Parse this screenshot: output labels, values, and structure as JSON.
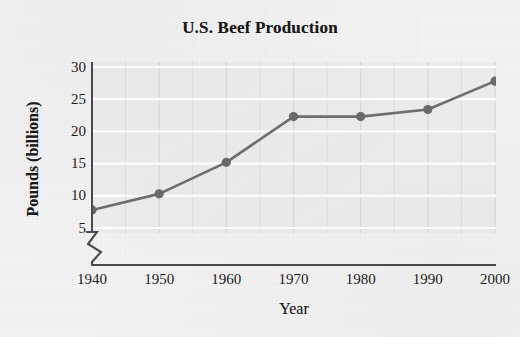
{
  "chart_data": {
    "type": "line",
    "title": "U.S. Beef Production",
    "xlabel": "Year",
    "ylabel": "Pounds (billions)",
    "x": [
      1940,
      1950,
      1960,
      1970,
      1980,
      1990,
      2000
    ],
    "values": [
      7.8,
      10.3,
      15.2,
      22.3,
      22.3,
      23.4,
      27.8
    ],
    "categories": [
      "1940",
      "1950",
      "1960",
      "1970",
      "1980",
      "1990",
      "2000"
    ],
    "xtick_labels": [
      "1940",
      "1950",
      "1960",
      "1970",
      "1980",
      "1990",
      "2000"
    ],
    "ytick_labels": [
      "30",
      "25",
      "20",
      "15",
      "10",
      "5"
    ],
    "ytick_values": [
      30,
      25,
      20,
      15,
      10,
      5
    ],
    "xlim": [
      1940,
      2000
    ],
    "ylim": [
      5,
      30
    ],
    "y_axis_break": true,
    "grid": true,
    "grid_minor_x": true,
    "legend": "none",
    "series": [
      {
        "name": "U.S. Beef Production",
        "values": [
          7.8,
          10.3,
          15.2,
          22.3,
          22.3,
          23.4,
          27.8
        ]
      }
    ],
    "colors": {
      "line": "#6e6e6e",
      "marker": "#6a6a6a",
      "axis": "#4a4a4a",
      "plot_background": "#ececec",
      "grid_horizontal": "#ffffff",
      "grid_vertical": "#d6d6d6",
      "page_background": "#f3f3f3",
      "text": "#1a1a1a"
    }
  }
}
